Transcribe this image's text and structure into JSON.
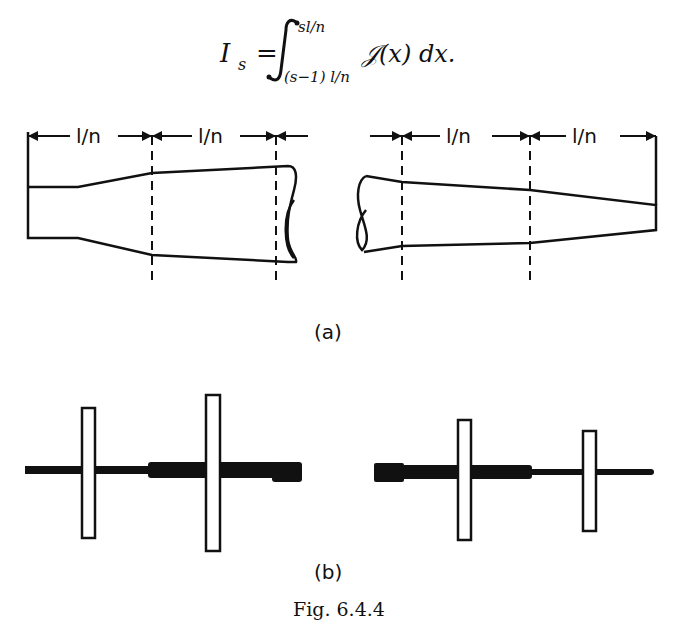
{
  "equation": {
    "lhs": "I",
    "lhs_sub": "s",
    "equals": "=",
    "upper_limit": "sl/n",
    "lower_limit": "(s−1) l/n",
    "integrand": "𝒥(x) dx."
  },
  "part_a": {
    "label": "(a)",
    "dimension_labels": [
      "l/n",
      "l/n",
      "l/n",
      "l/n"
    ]
  },
  "part_b": {
    "label": "(b)"
  },
  "caption": "Fig. 6.4.4"
}
